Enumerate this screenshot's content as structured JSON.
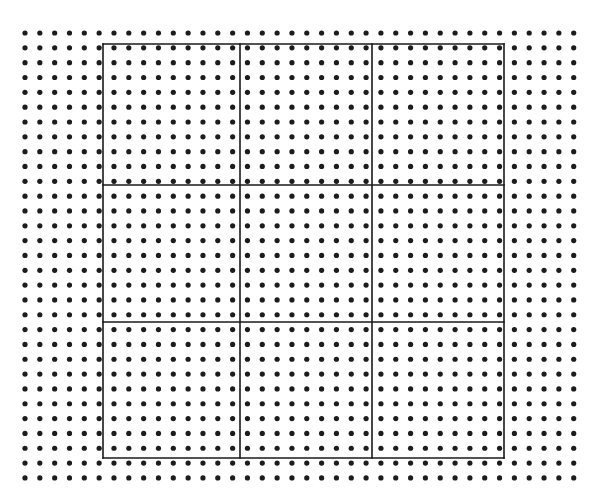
{
  "figure": {
    "type": "diagram",
    "canvas": {
      "width": 612,
      "height": 503,
      "background_color": "#ffffff"
    },
    "dot_field": {
      "description": "Regular square lattice of filled round dots covering the full canvas",
      "dot_color": "#1c1c1c",
      "dot_radius": 2.6,
      "origin_x": 25,
      "origin_y": 33,
      "spacing_x": 14.83,
      "spacing_y": 14.83,
      "columns": 38,
      "rows": 31,
      "total_dots": 1178
    },
    "frame": {
      "description": "Rectangle subdivided into a 3 by 3 arrangement of cells",
      "line_color": "#1a1a1a",
      "line_width": 1.6,
      "left": 103,
      "top": 44,
      "right": 504,
      "bottom": 458,
      "width": 401,
      "height": 414,
      "vertical_line_positions": [
        103,
        240,
        372,
        504
      ],
      "horizontal_line_positions": [
        44,
        185,
        322,
        458
      ],
      "columns": 3,
      "rows": 3,
      "cells": 9
    }
  }
}
